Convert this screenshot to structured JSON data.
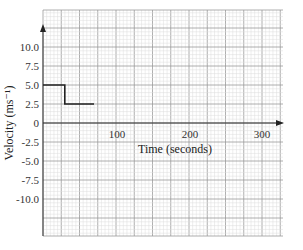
{
  "chart_data": {
    "type": "line",
    "title": "",
    "xlabel": "Time (seconds)",
    "ylabel": "Velocity (ms⁻¹)",
    "x_ticks": [
      "100",
      "200",
      "300"
    ],
    "y_ticks": [
      "10.0",
      "7.5",
      "5.0",
      "2.5",
      "0",
      "-2.5",
      "-5.0",
      "-7.5",
      "-10.0"
    ],
    "xlim": [
      0,
      330
    ],
    "ylim": [
      -15,
      15
    ],
    "grid": true,
    "series": [
      {
        "name": "velocity",
        "x": [
          0,
          30,
          30,
          70
        ],
        "y": [
          5.0,
          5.0,
          2.5,
          2.5
        ],
        "color": "#222222"
      }
    ]
  },
  "labels": {
    "x_axis": "Time (seconds)",
    "y_axis": "Velocity (ms⁻¹)",
    "x_tick_100": "100",
    "x_tick_200": "200",
    "x_tick_300": "300",
    "y_tick_10": "10.0",
    "y_tick_7_5": "7.5",
    "y_tick_5": "5.0",
    "y_tick_2_5": "2.5",
    "y_tick_0": "0",
    "y_tick_m2_5": "-2.5",
    "y_tick_m5": "-5.0",
    "y_tick_m7_5": "-7.5",
    "y_tick_m10": "-10.0"
  },
  "colors": {
    "grid_minor": "#dcdcdc",
    "grid_major": "#9a9a9a",
    "axis": "#333333",
    "line": "#222222"
  }
}
